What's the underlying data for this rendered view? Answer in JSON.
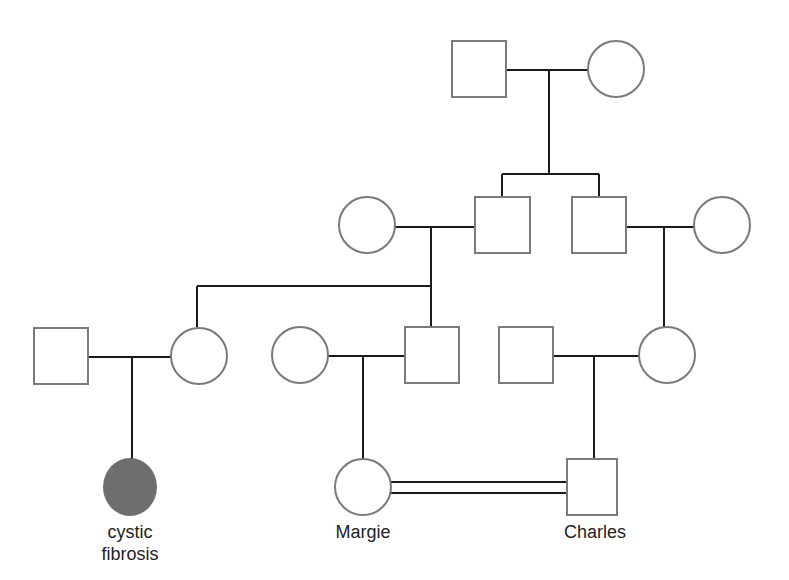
{
  "diagram": {
    "type": "pedigree",
    "colors": {
      "outline": "#7a7a7a",
      "line": "#1a1a1a",
      "affected_fill": "#6e6e6e"
    },
    "individuals": [
      {
        "id": "g1-male",
        "sex": "male",
        "affected": false
      },
      {
        "id": "g1-female",
        "sex": "female",
        "affected": false
      },
      {
        "id": "g2-wife-left",
        "sex": "female",
        "affected": false
      },
      {
        "id": "g2-son-1",
        "sex": "male",
        "affected": false
      },
      {
        "id": "g2-son-2",
        "sex": "male",
        "affected": false
      },
      {
        "id": "g2-wife-right",
        "sex": "female",
        "affected": false
      },
      {
        "id": "g3-husband-left",
        "sex": "male",
        "affected": false
      },
      {
        "id": "g3-daughter",
        "sex": "female",
        "affected": false
      },
      {
        "id": "g3-wife-mid",
        "sex": "female",
        "affected": false
      },
      {
        "id": "g3-son",
        "sex": "male",
        "affected": false
      },
      {
        "id": "g3-husband-right",
        "sex": "male",
        "affected": false
      },
      {
        "id": "g3-daughter-right",
        "sex": "female",
        "affected": false
      },
      {
        "id": "g4-affected-child",
        "sex": "female",
        "affected": true
      },
      {
        "id": "g4-margie",
        "sex": "female",
        "affected": false
      },
      {
        "id": "g4-charles",
        "sex": "male",
        "affected": false
      }
    ],
    "relationships": [
      {
        "type": "consanguineous",
        "between": [
          "g4-margie",
          "g4-charles"
        ]
      }
    ],
    "labels": {
      "affected_child_line1": "cystic",
      "affected_child_line2": "fibrosis",
      "margie": "Margie",
      "charles": "Charles"
    }
  }
}
